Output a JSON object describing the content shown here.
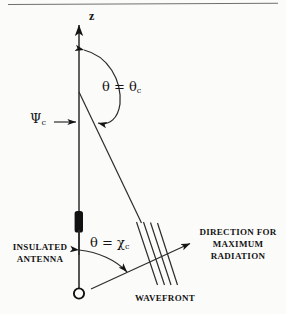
{
  "figure": {
    "background_color": "#fbfbfa",
    "ink_color": "#141414"
  },
  "labels": {
    "z_axis": "z",
    "theta_critical_symbol": "θ = θ",
    "theta_critical_sub": "c",
    "psi_symbol": "Ψ",
    "psi_sub": "c",
    "theta_chi_symbol": "θ = χ",
    "theta_chi_sub": "c",
    "insulated_antenna_line1": "INSULATED",
    "insulated_antenna_line2": "ANTENNA",
    "direction_line1": "DIRECTION  FOR",
    "direction_line2": "MAXIMUM",
    "direction_line3": "RADIATION",
    "wavefront": "WAVEFRONT"
  },
  "geometry": {
    "z_axis": {
      "x": 79,
      "y_top": 22,
      "y_bottom": 250
    },
    "critical_ray": {
      "x1": 79,
      "y1": 92,
      "x2": 141,
      "y2": 223
    },
    "antenna_stem": {
      "x": 79,
      "y_top": 232,
      "y_bottom": 293
    },
    "antenna_insulation_block": {
      "x": 75,
      "y": 211,
      "w": 8,
      "h": 21
    },
    "feed_circle": {
      "cx": 79,
      "cy": 293,
      "r": 5
    },
    "radiation_ray": {
      "x1": 93,
      "y1": 288,
      "x2": 190,
      "y2": 243
    },
    "wavefront_lines": 4
  },
  "icons": {
    "axis_arrow": "arrow-up-icon",
    "ray_arrow": "arrow-right-icon",
    "psi_pointer": "arrow-right-icon",
    "arc_double": "double-arrow-arc-icon",
    "feed_point": "circle-icon",
    "insulation": "filled-bar-icon"
  }
}
